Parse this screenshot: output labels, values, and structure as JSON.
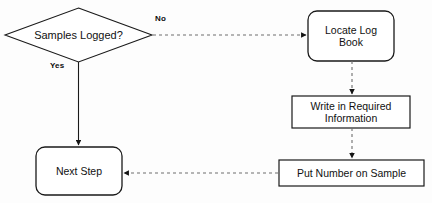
{
  "diagram": {
    "canvas": {
      "width": 432,
      "height": 203,
      "background": "#fdfdfd"
    },
    "stroke_color": "#1a1a1a",
    "dashed_stroke_color": "#6e6e6e",
    "text_color": "#111111",
    "nodes": [
      {
        "id": "decision",
        "shape": "diamond",
        "label": "Samples Logged?",
        "x": 5,
        "y": 8,
        "width": 147,
        "height": 54
      },
      {
        "id": "locate",
        "shape": "rounded-rectangle",
        "label": "Locate Log\nBook",
        "x": 308,
        "y": 11,
        "width": 86,
        "height": 50
      },
      {
        "id": "write",
        "shape": "rectangle",
        "label": "Write in Required\nInformation",
        "x": 292,
        "y": 96,
        "width": 118,
        "height": 32
      },
      {
        "id": "put",
        "shape": "rectangle",
        "label": "Put Number on Sample",
        "x": 279,
        "y": 160,
        "width": 145,
        "height": 26
      },
      {
        "id": "next",
        "shape": "rounded-rectangle",
        "label": "Next Step",
        "x": 36,
        "y": 147,
        "width": 86,
        "height": 48
      }
    ],
    "edges": [
      {
        "id": "decision-to-locate",
        "from": "decision",
        "to": "locate",
        "label": "No",
        "style": "dashed",
        "direction": "right"
      },
      {
        "id": "decision-to-next",
        "from": "decision",
        "to": "next",
        "label": "Yes",
        "style": "solid",
        "direction": "down"
      },
      {
        "id": "locate-to-write",
        "from": "locate",
        "to": "write",
        "label": "",
        "style": "dashed",
        "direction": "down"
      },
      {
        "id": "write-to-put",
        "from": "write",
        "to": "put",
        "label": "",
        "style": "dashed",
        "direction": "down"
      },
      {
        "id": "put-to-next",
        "from": "put",
        "to": "next",
        "label": "",
        "style": "dashed",
        "direction": "left"
      }
    ]
  }
}
